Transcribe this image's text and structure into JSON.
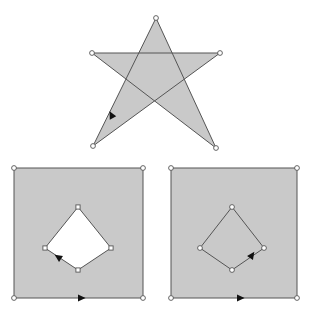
{
  "figure": {
    "background_color": "#ffffff",
    "fill_color": "#c9c9c9",
    "hole_color": "#ffffff",
    "edge_color": "#555555",
    "vertex_marker_color": "#ffffff",
    "arrow_color": "#111111",
    "canvas": {
      "width": 314,
      "height": 316
    }
  },
  "shapes": {
    "star": {
      "name": "five-pointed-star",
      "type": "self-intersecting-polygon",
      "fill": "#c9c9c9",
      "points": "156,18 184,103 92,53 220,53 128,103",
      "vertices": [
        {
          "x": 156,
          "y": 18,
          "label": "top-point"
        },
        {
          "x": 216,
          "y": 148,
          "label": "bottom-right-point"
        },
        {
          "x": 92,
          "y": 53,
          "label": "left-point"
        },
        {
          "x": 220,
          "y": 53,
          "label": "right-point"
        },
        {
          "x": 93,
          "y": 146,
          "label": "bottom-left-point"
        }
      ],
      "polygon_path": "156,18 216,148 92,53 220,53 93,146",
      "arrow": {
        "x": 113,
        "y": 118,
        "rotation": 243,
        "direction": "down-left",
        "on_edge": "right-point-to-bottom-left-point"
      }
    },
    "left_square": {
      "name": "square-with-diamond-hole",
      "fill": "#c9c9c9",
      "outer": {
        "x": 14,
        "y": 168,
        "width": 129,
        "height": 130
      },
      "outer_vertices": [
        {
          "x": 14,
          "y": 168
        },
        {
          "x": 143,
          "y": 168
        },
        {
          "x": 143,
          "y": 298
        },
        {
          "x": 14,
          "y": 298
        }
      ],
      "hole": {
        "name": "diamond-hole",
        "fill": "#ffffff",
        "points": "78,208 111,248 78,270 45,248",
        "vertices": [
          {
            "x": 78,
            "y": 207
          },
          {
            "x": 111,
            "y": 248
          },
          {
            "x": 78,
            "y": 270
          },
          {
            "x": 45,
            "y": 248
          }
        ]
      },
      "arrows": [
        {
          "x": 78,
          "y": 298,
          "rotation": 0,
          "direction": "right",
          "on_edge": "bottom"
        },
        {
          "x": 61,
          "y": 259,
          "rotation": 213,
          "direction": "down-left",
          "on_edge": "hole-lower-left"
        }
      ]
    },
    "right_square": {
      "name": "square-with-diamond-outline",
      "fill": "#c9c9c9",
      "outer": {
        "x": 171,
        "y": 168,
        "width": 126,
        "height": 130
      },
      "outer_vertices": [
        {
          "x": 171,
          "y": 168
        },
        {
          "x": 297,
          "y": 168
        },
        {
          "x": 297,
          "y": 298
        },
        {
          "x": 171,
          "y": 298
        }
      ],
      "hole": {
        "name": "diamond-outline",
        "fill": "#c9c9c9",
        "points": "232,207 264,248 232,270 200,248",
        "vertices": [
          {
            "x": 232,
            "y": 207
          },
          {
            "x": 264,
            "y": 248
          },
          {
            "x": 232,
            "y": 270
          },
          {
            "x": 200,
            "y": 248
          }
        ]
      },
      "arrows": [
        {
          "x": 237,
          "y": 298,
          "rotation": 0,
          "direction": "right",
          "on_edge": "bottom"
        },
        {
          "x": 250,
          "y": 258,
          "rotation": 305,
          "direction": "up-right",
          "on_edge": "diamond-lower-right"
        }
      ]
    }
  }
}
